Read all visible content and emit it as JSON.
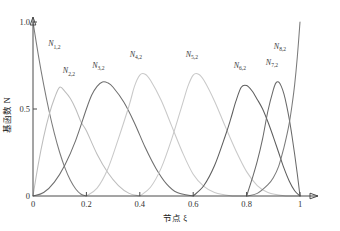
{
  "chart_data": {
    "type": "line",
    "title": "",
    "xlabel": "节点 ξ",
    "ylabel": "基函数 N",
    "xlim": [
      0,
      1
    ],
    "ylim": [
      0,
      1
    ],
    "grid": false,
    "legend": "none",
    "x_ticks": [
      "0",
      "0.2",
      "0.4",
      "0.6",
      "0.8",
      "1"
    ],
    "x_tick_values": [
      0,
      0.2,
      0.4,
      0.6,
      0.8,
      1
    ],
    "y_ticks": [
      "0.5",
      "1.0"
    ],
    "y_tick_values": [
      0.5,
      1.0
    ],
    "degree": 2,
    "knot_vector": [
      0,
      0,
      0,
      0.2,
      0.4,
      0.6,
      0.8,
      1,
      1,
      1
    ],
    "series": [
      {
        "name": "N1,2",
        "label": "N",
        "sub": "1,2",
        "color": "#7b7b7b",
        "peak_x": 0.0,
        "peak_y": 1.0,
        "support": [
          0.0,
          0.2
        ],
        "label_x": 0.08,
        "label_y": 0.86,
        "points": [
          [
            0.0,
            1.0
          ],
          [
            0.02,
            0.81
          ],
          [
            0.04,
            0.64
          ],
          [
            0.06,
            0.49
          ],
          [
            0.08,
            0.36
          ],
          [
            0.1,
            0.25
          ],
          [
            0.12,
            0.16
          ],
          [
            0.14,
            0.09
          ],
          [
            0.16,
            0.04
          ],
          [
            0.18,
            0.01
          ],
          [
            0.2,
            0.0
          ]
        ]
      },
      {
        "name": "N2,2",
        "label": "N",
        "sub": "2,2",
        "color": "#bdbdbd",
        "peak_x": 0.1,
        "peak_y": 0.625,
        "support": [
          0.0,
          0.4
        ],
        "label_x": 0.135,
        "label_y": 0.705,
        "points": [
          [
            0.0,
            0.0
          ],
          [
            0.02,
            0.185
          ],
          [
            0.04,
            0.34
          ],
          [
            0.06,
            0.465
          ],
          [
            0.08,
            0.56
          ],
          [
            0.1,
            0.625
          ],
          [
            0.12,
            0.6
          ],
          [
            0.14,
            0.56
          ],
          [
            0.16,
            0.5
          ],
          [
            0.18,
            0.425
          ],
          [
            0.2,
            0.375
          ],
          [
            0.24,
            0.24
          ],
          [
            0.28,
            0.135
          ],
          [
            0.32,
            0.06
          ],
          [
            0.36,
            0.015
          ],
          [
            0.4,
            0.0
          ]
        ]
      },
      {
        "name": "N3,2",
        "label": "N",
        "sub": "3,2",
        "color": "#6e6e6e",
        "peak_x": 0.2,
        "peak_y": 0.655,
        "support": [
          0.0,
          0.6
        ],
        "label_x": 0.245,
        "label_y": 0.735,
        "points": [
          [
            0.0,
            0.0
          ],
          [
            0.04,
            0.02
          ],
          [
            0.08,
            0.08
          ],
          [
            0.12,
            0.18
          ],
          [
            0.16,
            0.32
          ],
          [
            0.2,
            0.5
          ],
          [
            0.22,
            0.58
          ],
          [
            0.24,
            0.63
          ],
          [
            0.26,
            0.655
          ],
          [
            0.28,
            0.65
          ],
          [
            0.3,
            0.625
          ],
          [
            0.34,
            0.54
          ],
          [
            0.38,
            0.42
          ],
          [
            0.42,
            0.28
          ],
          [
            0.46,
            0.16
          ],
          [
            0.5,
            0.07
          ],
          [
            0.54,
            0.02
          ],
          [
            0.6,
            0.0
          ]
        ]
      },
      {
        "name": "N4,2",
        "label": "N",
        "sub": "4,2",
        "color": "#c9c9c9",
        "peak_x": 0.4,
        "peak_y": 0.7,
        "support": [
          0.2,
          0.8
        ],
        "label_x": 0.385,
        "label_y": 0.8,
        "points": [
          [
            0.2,
            0.0
          ],
          [
            0.24,
            0.045
          ],
          [
            0.28,
            0.155
          ],
          [
            0.32,
            0.33
          ],
          [
            0.36,
            0.52
          ],
          [
            0.38,
            0.63
          ],
          [
            0.4,
            0.695
          ],
          [
            0.42,
            0.7
          ],
          [
            0.44,
            0.665
          ],
          [
            0.48,
            0.55
          ],
          [
            0.52,
            0.4
          ],
          [
            0.56,
            0.25
          ],
          [
            0.6,
            0.125
          ],
          [
            0.64,
            0.055
          ],
          [
            0.68,
            0.02
          ],
          [
            0.74,
            0.002
          ],
          [
            0.8,
            0.0
          ]
        ]
      },
      {
        "name": "N5,2",
        "label": "N",
        "sub": "5,2",
        "color": "#c9c9c9",
        "peak_x": 0.6,
        "peak_y": 0.7,
        "support": [
          0.4,
          1.0
        ],
        "label_x": 0.595,
        "label_y": 0.8,
        "points": [
          [
            0.4,
            0.0
          ],
          [
            0.44,
            0.05
          ],
          [
            0.48,
            0.16
          ],
          [
            0.52,
            0.33
          ],
          [
            0.56,
            0.53
          ],
          [
            0.58,
            0.63
          ],
          [
            0.6,
            0.695
          ],
          [
            0.62,
            0.7
          ],
          [
            0.64,
            0.665
          ],
          [
            0.68,
            0.545
          ],
          [
            0.72,
            0.4
          ],
          [
            0.76,
            0.26
          ],
          [
            0.8,
            0.14
          ],
          [
            0.84,
            0.06
          ],
          [
            0.88,
            0.02
          ],
          [
            0.94,
            0.002
          ],
          [
            1.0,
            0.0
          ]
        ]
      },
      {
        "name": "N6,2",
        "label": "N",
        "sub": "6,2",
        "color": "#5e5e5e",
        "peak_x": 0.78,
        "peak_y": 0.635,
        "support": [
          0.6,
          1.0
        ],
        "label_x": 0.775,
        "label_y": 0.735,
        "points": [
          [
            0.6,
            0.0
          ],
          [
            0.64,
            0.06
          ],
          [
            0.68,
            0.175
          ],
          [
            0.72,
            0.345
          ],
          [
            0.74,
            0.44
          ],
          [
            0.76,
            0.545
          ],
          [
            0.78,
            0.625
          ],
          [
            0.8,
            0.635
          ],
          [
            0.82,
            0.605
          ],
          [
            0.84,
            0.555
          ],
          [
            0.86,
            0.5
          ],
          [
            0.88,
            0.425
          ],
          [
            0.9,
            0.34
          ],
          [
            0.92,
            0.25
          ],
          [
            0.94,
            0.16
          ],
          [
            0.96,
            0.085
          ],
          [
            0.98,
            0.03
          ],
          [
            1.0,
            0.0
          ]
        ]
      },
      {
        "name": "N7,2",
        "label": "N",
        "sub": "7,2",
        "color": "#6a6a6a",
        "peak_x": 0.9,
        "peak_y": 0.655,
        "support": [
          0.8,
          1.0
        ],
        "label_x": 0.895,
        "label_y": 0.755,
        "points": [
          [
            0.8,
            0.0
          ],
          [
            0.82,
            0.095
          ],
          [
            0.84,
            0.2
          ],
          [
            0.86,
            0.33
          ],
          [
            0.88,
            0.49
          ],
          [
            0.9,
            0.61
          ],
          [
            0.91,
            0.65
          ],
          [
            0.92,
            0.655
          ],
          [
            0.93,
            0.63
          ],
          [
            0.94,
            0.585
          ],
          [
            0.95,
            0.52
          ],
          [
            0.96,
            0.44
          ],
          [
            0.97,
            0.345
          ],
          [
            0.98,
            0.24
          ],
          [
            0.99,
            0.125
          ],
          [
            1.0,
            0.0
          ]
        ]
      },
      {
        "name": "N8,2",
        "label": "N",
        "sub": "8,2",
        "color": "#7b7b7b",
        "peak_x": 1.0,
        "peak_y": 1.0,
        "support": [
          0.8,
          1.0
        ],
        "label_x": 0.925,
        "label_y": 0.845,
        "points": [
          [
            0.8,
            0.0
          ],
          [
            0.84,
            0.015
          ],
          [
            0.88,
            0.065
          ],
          [
            0.9,
            0.105
          ],
          [
            0.92,
            0.17
          ],
          [
            0.94,
            0.28
          ],
          [
            0.95,
            0.345
          ],
          [
            0.96,
            0.42
          ],
          [
            0.97,
            0.52
          ],
          [
            0.98,
            0.64
          ],
          [
            0.99,
            0.8
          ],
          [
            1.0,
            1.0
          ]
        ]
      }
    ]
  }
}
